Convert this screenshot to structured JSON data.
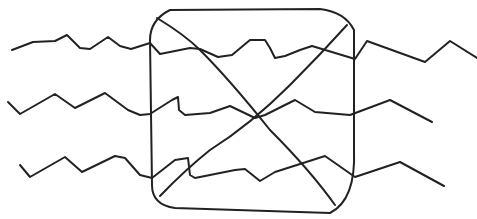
{
  "illustration": {
    "description": "Hand-drawn sketch: three wavy/zigzag horizontal lines pass through a rounded square, crossed by two diagonal lines forming an X",
    "stroke_color": "#222222",
    "background_color": "#ffffff"
  }
}
